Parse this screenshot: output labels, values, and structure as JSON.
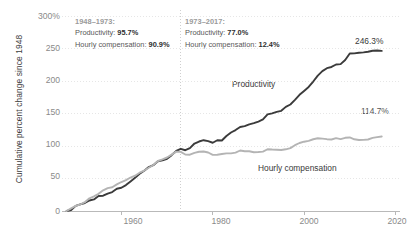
{
  "chart_data": {
    "type": "line",
    "title": "",
    "xlabel": "",
    "ylabel": "Cumulative percent change since 1948",
    "xlim": [
      1947,
      2021
    ],
    "ylim": [
      0,
      300
    ],
    "grid": true,
    "legend_position": "inline-on-series",
    "x_ticks": [
      "1960",
      "1980",
      "2000",
      "2020"
    ],
    "x_tick_values": [
      1960,
      1980,
      2000,
      2020
    ],
    "y_ticks": [
      "300%",
      "250",
      "200",
      "150",
      "100",
      "50",
      "0"
    ],
    "y_tick_values": [
      300,
      250,
      200,
      150,
      100,
      50,
      0
    ],
    "divider_year": 1973,
    "series": [
      {
        "name": "Productivity",
        "color": "#3b3b3b",
        "end_label": "246.3%",
        "end_value": 246.3,
        "x": [
          1948,
          1949,
          1950,
          1951,
          1952,
          1953,
          1954,
          1955,
          1956,
          1957,
          1958,
          1959,
          1960,
          1961,
          1962,
          1963,
          1964,
          1965,
          1966,
          1967,
          1968,
          1969,
          1970,
          1971,
          1972,
          1973,
          1974,
          1975,
          1976,
          1977,
          1978,
          1979,
          1980,
          1981,
          1982,
          1983,
          1984,
          1985,
          1986,
          1987,
          1988,
          1989,
          1990,
          1991,
          1992,
          1993,
          1994,
          1995,
          1996,
          1997,
          1998,
          1999,
          2000,
          2001,
          2002,
          2003,
          2004,
          2005,
          2006,
          2007,
          2008,
          2009,
          2010,
          2011,
          2012,
          2013,
          2014,
          2015,
          2016,
          2017
        ],
        "values": [
          0,
          1.6,
          7.9,
          10.3,
          12.3,
          16.1,
          17.8,
          23.0,
          23.5,
          26.8,
          29.1,
          34.3,
          35.8,
          39.9,
          45.5,
          51.0,
          57.2,
          62.0,
          67.6,
          70.4,
          76.6,
          77.8,
          80.2,
          85.9,
          92.4,
          95.7,
          93.5,
          96.7,
          103.8,
          106.9,
          108.9,
          107.5,
          105.0,
          108.9,
          108.4,
          115.4,
          120.8,
          124.5,
          129.3,
          130.6,
          133.3,
          135.1,
          137.6,
          140.8,
          148.6,
          150.2,
          152.4,
          154.1,
          160.2,
          163.9,
          170.9,
          178.7,
          184.7,
          190.9,
          199.2,
          208.2,
          215.2,
          219.7,
          221.6,
          225.4,
          226.0,
          232.3,
          242.3,
          242.5,
          243.4,
          244.1,
          245.0,
          246.6,
          247.0,
          246.3
        ]
      },
      {
        "name": "Hourly compensation",
        "color": "#b4b4b4",
        "end_label": "114.7%",
        "end_value": 114.7,
        "x": [
          1948,
          1949,
          1950,
          1951,
          1952,
          1953,
          1954,
          1955,
          1956,
          1957,
          1958,
          1959,
          1960,
          1961,
          1962,
          1963,
          1964,
          1965,
          1966,
          1967,
          1968,
          1969,
          1970,
          1971,
          1972,
          1973,
          1974,
          1975,
          1976,
          1977,
          1978,
          1979,
          1980,
          1981,
          1982,
          1983,
          1984,
          1985,
          1986,
          1987,
          1988,
          1989,
          1990,
          1991,
          1992,
          1993,
          1994,
          1995,
          1996,
          1997,
          1998,
          1999,
          2000,
          2001,
          2002,
          2003,
          2004,
          2005,
          2006,
          2007,
          2008,
          2009,
          2010,
          2011,
          2012,
          2013,
          2014,
          2015,
          2016,
          2017
        ],
        "values": [
          0,
          4.0,
          8.0,
          10.0,
          13.6,
          19.6,
          22.4,
          26.4,
          31.8,
          35.2,
          36.5,
          41.0,
          44.6,
          47.6,
          51.5,
          54.3,
          58.9,
          62.2,
          66.6,
          70.7,
          76.9,
          79.4,
          82.3,
          86.8,
          91.3,
          90.9,
          86.9,
          86.6,
          89.5,
          91.1,
          91.6,
          90.0,
          86.4,
          86.5,
          87.6,
          88.7,
          88.6,
          89.8,
          93.1,
          92.0,
          92.0,
          90.4,
          90.8,
          91.4,
          95.0,
          94.5,
          94.2,
          93.8,
          94.9,
          96.8,
          101.2,
          104.6,
          106.6,
          107.9,
          110.4,
          111.9,
          111.4,
          110.5,
          110.0,
          112.1,
          110.6,
          112.6,
          113.1,
          110.3,
          109.2,
          109.4,
          110.0,
          112.5,
          113.6,
          114.7
        ]
      }
    ],
    "annotations": [
      {
        "id": "period-1",
        "period": "1948–1973:",
        "rows": [
          {
            "label": "Productivity:",
            "value": "95.7%"
          },
          {
            "label": "Hourly compensation:",
            "value": "90.9%"
          }
        ]
      },
      {
        "id": "period-2",
        "period": "1973–2017:",
        "rows": [
          {
            "label": "Productivity:",
            "value": "77.0%"
          },
          {
            "label": "Hourly compensation:",
            "value": "12.4%"
          }
        ]
      }
    ]
  },
  "colors": {
    "productivity": "#3b3b3b",
    "compensation": "#b4b4b4",
    "grid": "#e6e6e6",
    "axis": "#b9b9b9",
    "tick_text": "#8a8a8a",
    "annotation_head": "#9a9a9a",
    "annotation_text": "#575757"
  }
}
